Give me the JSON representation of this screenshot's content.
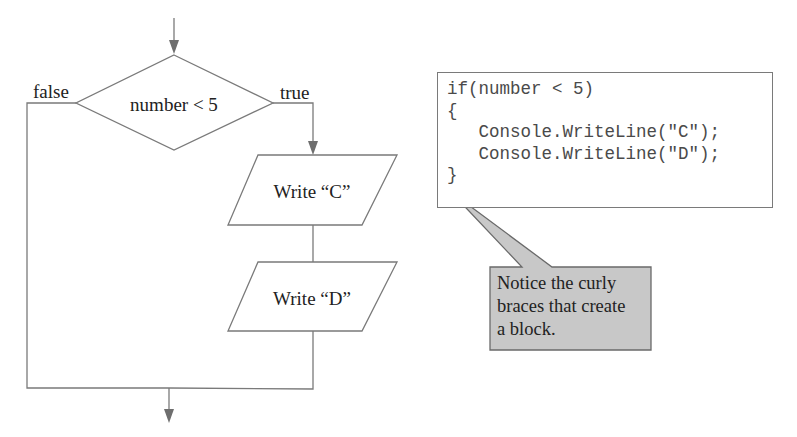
{
  "flowchart": {
    "decision": {
      "condition": "number < 5",
      "false_label": "false",
      "true_label": "true"
    },
    "steps": [
      {
        "label": "Write “C”"
      },
      {
        "label": "Write “D”"
      }
    ]
  },
  "code": {
    "lines": [
      "if(number < 5)",
      "{",
      "   Console.WriteLine(\"C\");",
      "   Console.WriteLine(\"D\");",
      "}"
    ]
  },
  "callout": {
    "lines": [
      "Notice the curly",
      "braces that create",
      "a block."
    ]
  },
  "colors": {
    "line": "#7a7a7a",
    "callout_fill": "#c8c8c8",
    "text": "#222222",
    "code_text": "#4a4a4a"
  }
}
